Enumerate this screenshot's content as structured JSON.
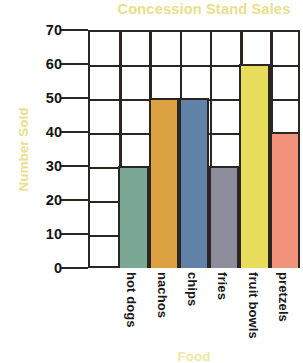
{
  "chart_data": {
    "type": "bar",
    "title": "Concession Stand Sales",
    "xlabel": "Food",
    "ylabel": "Number Sold",
    "categories": [
      "hot dogs",
      "nachos",
      "chips",
      "fries",
      "fruit bowls",
      "pretzels"
    ],
    "values": [
      30,
      50,
      50,
      30,
      60,
      40
    ],
    "bar_colors": [
      "#7aa894",
      "#dca23f",
      "#5f82a6",
      "#8d8d9c",
      "#e8dc5c",
      "#f0937a"
    ],
    "ylim": [
      0,
      70
    ],
    "yticks": [
      0,
      10,
      20,
      30,
      40,
      50,
      60,
      70
    ],
    "ytick_labels": [
      "0",
      "10",
      "20",
      "30",
      "40",
      "50",
      "60",
      "70"
    ],
    "grid": true,
    "legend": "none",
    "title_color": "#e8e08a",
    "axis_label_color": "#e8e08a",
    "grid_color": "#2b2622",
    "empty_leading_column": true
  }
}
